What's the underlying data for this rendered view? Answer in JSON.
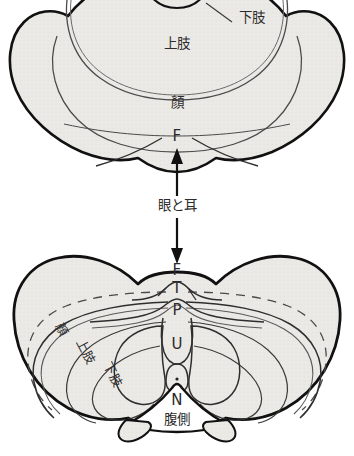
{
  "figure": {
    "type": "anatomical-schematic",
    "background_color": "#ffffff",
    "fill_color": "#ebe9e5",
    "outline_color": "#111111",
    "inner_line_color": "#4a4a4a",
    "label_color": "#2b2b2b"
  },
  "upper_panel": {
    "name": "upper-section-diagram",
    "labels": {
      "lower_limb": "下肢",
      "upper_limb": "上肢",
      "face": "顏",
      "f_marker": "F"
    }
  },
  "connector": {
    "name": "eye-and-ear-connector",
    "label": "眼と耳",
    "arrow_up": "↑",
    "arrow_down": "↓"
  },
  "lower_panel": {
    "name": "lower-section-diagram",
    "midline_letters": [
      "F",
      "T",
      "P",
      "U",
      "N"
    ],
    "labels": {
      "face": "顏",
      "upper_limb": "上肢",
      "lower_limb": "下肢",
      "ventral": "腹側"
    }
  }
}
